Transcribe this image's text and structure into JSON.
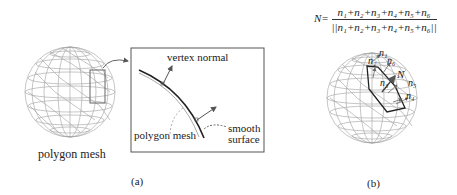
{
  "panel_a": {
    "sphere_label": "polygon mesh",
    "inset": {
      "vertex_normal_label": "vertex normal",
      "polygon_mesh_label": "polygon mesh",
      "smooth_surface_label_line1": "smooth",
      "smooth_surface_label_line2": "surface"
    },
    "caption": "(a)"
  },
  "panel_b": {
    "formula": {
      "lhs": "N=",
      "numerator": "n₁+n₂+n₃+n₄+n₅+n₆",
      "denominator": "||n₁+n₂+n₃+n₄+n₅+n₆||"
    },
    "normal_labels": {
      "n1": "n₁",
      "n2": "n₂",
      "n3": "n₃",
      "n4": "n₄",
      "n5": "n₅",
      "n6": "n₆",
      "N": "N"
    },
    "caption": "(b)"
  },
  "colors": {
    "mesh_line": "#9a9a9a",
    "dark_line": "#222222",
    "highlight_box": "#6a6a6a",
    "arrow": "#555555"
  }
}
